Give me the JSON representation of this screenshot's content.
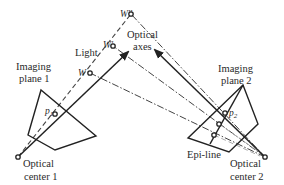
{
  "diagram": {
    "type": "epipolar-geometry",
    "labels": {
      "light": "Light",
      "optical_axes_line1": "Optical",
      "optical_axes_line2": "axes",
      "imaging_plane_1_line1": "Imaging",
      "imaging_plane_1_line2": "plane 1",
      "imaging_plane_2_line1": "Imaging",
      "imaging_plane_2_line2": "plane 2",
      "optical_center_1_line1": "Optical",
      "optical_center_1_line2": "center 1",
      "optical_center_2_line1": "Optical",
      "optical_center_2_line2": "center 2",
      "epi_line": "Epi-line",
      "point_w": "W",
      "point_w_prime": "W'",
      "point_w_double_prime": "W''",
      "p1_base": "p",
      "p1_sub": "1",
      "p2_base": "p",
      "p2_sub": "2"
    },
    "nodes": [
      {
        "id": "optical-center-1",
        "x": 18,
        "y": 157
      },
      {
        "id": "optical-center-2",
        "x": 265,
        "y": 157
      },
      {
        "id": "W",
        "x": 90,
        "y": 73
      },
      {
        "id": "W'",
        "x": 113,
        "y": 46
      },
      {
        "id": "W''",
        "x": 131,
        "y": 14
      },
      {
        "id": "p1",
        "x": 55,
        "y": 114
      },
      {
        "id": "p2",
        "x": 225,
        "y": 113
      }
    ],
    "colors": {
      "line": "#222222",
      "text": "#2a2a2a",
      "background": "#ffffff"
    }
  }
}
